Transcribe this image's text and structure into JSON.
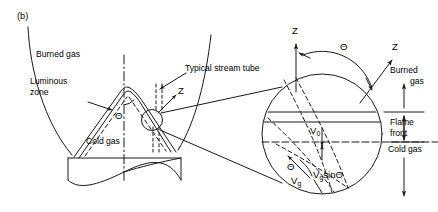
{
  "figure": {
    "panel_label": "(b)",
    "domain": "combustion-flame-front-geometry"
  },
  "left_view": {
    "name": "bunsen-burner-flame-cross-section",
    "labels": {
      "burned_gas": "Burned gas",
      "luminous_zone_line1": "Luminous",
      "luminous_zone_line2": "zone",
      "cold_gas": "Cold gas",
      "cone_half_angle": "Θ",
      "stream_tube_line1": "Typical stream tube",
      "axis_z": "Z"
    }
  },
  "magnified_view": {
    "name": "magnified-flame-front-detail",
    "labels": {
      "axis_z_vertical": "Z",
      "axis_z_normal": "Z",
      "angle_theta_top": "Θ",
      "angle_theta_bottom": "Θ",
      "velocity_v0_base": "V",
      "velocity_v0_sub": "0",
      "velocity_vg_base": "V",
      "velocity_vg_sub": "g",
      "velocity_vgsin_base": "V",
      "velocity_vgsin_sub": "g",
      "velocity_vgsin_tail": "sinΘ",
      "burned_gas_line1": "Burned",
      "burned_gas_line2": "gas",
      "flame_front_line1": "Flame",
      "flame_front_line2": "front",
      "cold_gas": "Cold gas"
    }
  },
  "colors": {
    "stroke": "#1a1a1a",
    "background": "#ffffff",
    "text": "#000000"
  }
}
